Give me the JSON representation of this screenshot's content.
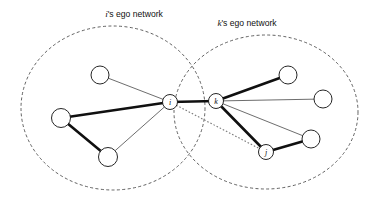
{
  "figure": {
    "background_color": "#ffffff",
    "width": 376,
    "height": 204
  },
  "regions": [
    {
      "id": "i-ego-network",
      "owner": "i",
      "label_prefix": "i",
      "label_suffix": "'s ego network",
      "label_full": "i's ego network",
      "label_x": 134,
      "label_y": 17,
      "cx": 113,
      "cy": 108,
      "rx": 92,
      "ry": 82,
      "style": "dashed",
      "color": "#3a3a3a"
    },
    {
      "id": "k-ego-network",
      "owner": "k",
      "label_prefix": "k",
      "label_suffix": "'s ego network",
      "label_full": "k's ego network",
      "label_x": 247,
      "label_y": 26,
      "cx": 266,
      "cy": 112,
      "rx": 92,
      "ry": 77,
      "style": "dashed",
      "color": "#3a3a3a"
    }
  ],
  "nodes": [
    {
      "id": "a",
      "label": "",
      "x": 100,
      "y": 75,
      "r": 9,
      "labeled": false
    },
    {
      "id": "b",
      "label": "",
      "x": 61,
      "y": 118,
      "r": 9.5,
      "labeled": false
    },
    {
      "id": "c",
      "label": "",
      "x": 108,
      "y": 157,
      "r": 9.5,
      "labeled": false
    },
    {
      "id": "i",
      "label": "i",
      "x": 170,
      "y": 102,
      "r": 7.5,
      "labeled": true
    },
    {
      "id": "k",
      "label": "k",
      "x": 216,
      "y": 101,
      "r": 7.5,
      "labeled": true
    },
    {
      "id": "d",
      "label": "",
      "x": 288,
      "y": 75,
      "r": 9,
      "labeled": false
    },
    {
      "id": "e",
      "label": "",
      "x": 323,
      "y": 99,
      "r": 9,
      "labeled": false
    },
    {
      "id": "f",
      "label": "",
      "x": 311,
      "y": 139,
      "r": 9,
      "labeled": false
    },
    {
      "id": "j",
      "label": "j",
      "x": 266,
      "y": 152,
      "r": 7.5,
      "labeled": true
    }
  ],
  "edges": [
    {
      "source": "a",
      "target": "i",
      "weight": "thin"
    },
    {
      "source": "b",
      "target": "i",
      "weight": "thick"
    },
    {
      "source": "b",
      "target": "c",
      "weight": "thick"
    },
    {
      "source": "c",
      "target": "i",
      "weight": "thin"
    },
    {
      "source": "i",
      "target": "k",
      "weight": "thick"
    },
    {
      "source": "i",
      "target": "j",
      "weight": "dotted"
    },
    {
      "source": "k",
      "target": "d",
      "weight": "thick"
    },
    {
      "source": "k",
      "target": "e",
      "weight": "thin"
    },
    {
      "source": "k",
      "target": "f",
      "weight": "thin"
    },
    {
      "source": "k",
      "target": "j",
      "weight": "thick"
    },
    {
      "source": "j",
      "target": "f",
      "weight": "thick"
    }
  ]
}
